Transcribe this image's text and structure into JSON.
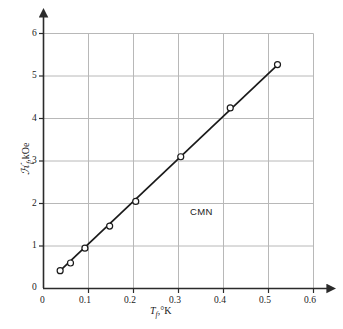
{
  "chart_data": {
    "type": "scatter",
    "title": "",
    "subtitle": "",
    "xlabel": "T_f, °K",
    "ylabel": "H_f, kOe",
    "xlabel_parts": {
      "symbol": "T",
      "subscript": "f",
      "separator": ",",
      "unit": "°K"
    },
    "ylabel_parts": {
      "symbol": "ℋ",
      "subscript": "f",
      "separator": ",",
      "unit": "kOe"
    },
    "xlim": [
      0,
      0.6
    ],
    "ylim": [
      0,
      6
    ],
    "xticks": [
      0,
      0.1,
      0.2,
      0.3,
      0.4,
      0.5,
      0.6
    ],
    "xtick_labels": [
      "0",
      "0.1",
      "0.2",
      "0.3",
      "0.4",
      "0.5",
      "0.6"
    ],
    "yticks": [
      0,
      1,
      2,
      3,
      4,
      5,
      6
    ],
    "ytick_labels": [
      "0",
      "1",
      "2",
      "3",
      "4",
      "5",
      "6"
    ],
    "grid": true,
    "grid_color": "#b8b8b8",
    "axis_color": "#2b2b2b",
    "line_color": "#1a1a1a",
    "marker_color": "#ffffff",
    "marker_edge_color": "#1a1a1a",
    "marker": "open-circle",
    "legend": null,
    "legend_position": "none",
    "annotations": [
      {
        "text": "CMN",
        "x": 0.35,
        "y": 1.8
      }
    ],
    "x": [
      0.037,
      0.06,
      0.092,
      0.147,
      0.205,
      0.305,
      0.415,
      0.52
    ],
    "y": [
      0.42,
      0.6,
      0.95,
      1.47,
      2.05,
      3.1,
      4.25,
      5.27
    ],
    "series": [
      {
        "name": "CMN",
        "x": [
          0.037,
          0.06,
          0.092,
          0.147,
          0.205,
          0.305,
          0.415,
          0.52
        ],
        "values": [
          0.42,
          0.6,
          0.95,
          1.47,
          2.05,
          3.1,
          4.25,
          5.27
        ]
      }
    ],
    "fit_line": {
      "x": [
        0.033,
        0.522
      ],
      "y": [
        0.38,
        5.28
      ]
    }
  }
}
